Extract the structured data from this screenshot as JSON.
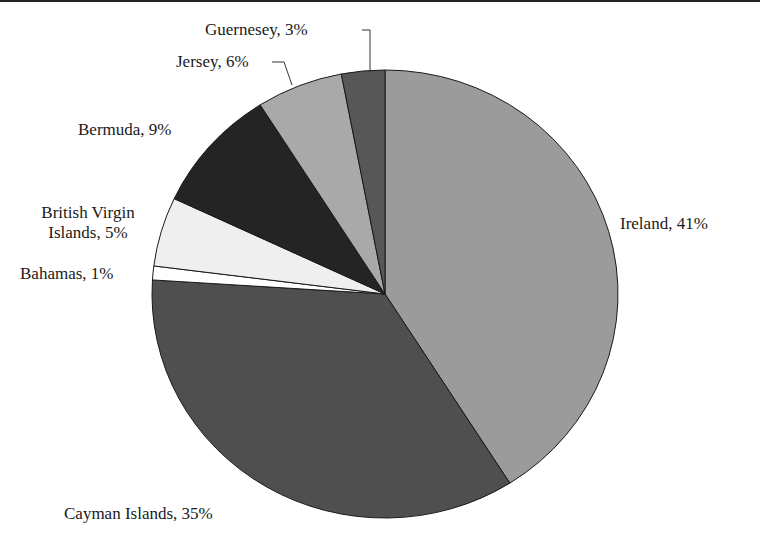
{
  "chart_data": {
    "type": "pie",
    "title": "",
    "start_angle_deg": 0,
    "direction": "clockwise",
    "slices": [
      {
        "label": "Ireland",
        "value": 41,
        "text": "Ireland, 41%",
        "color": "#9b9b9b"
      },
      {
        "label": "Cayman Islands",
        "value": 35,
        "text": "Cayman Islands, 35%",
        "color": "#4f4f4f"
      },
      {
        "label": "Bahamas",
        "value": 1,
        "text": "Bahamas, 1%",
        "color": "#ffffff"
      },
      {
        "label": "British Virgin Islands",
        "value": 5,
        "text_line1": "British Virgin",
        "text_line2": "Islands, 5%",
        "color": "#efefef"
      },
      {
        "label": "Bermuda",
        "value": 9,
        "text": "Bermuda, 9%",
        "color": "#242424"
      },
      {
        "label": "Jersey",
        "value": 6,
        "text": "Jersey, 6%",
        "color": "#a9a9a9"
      },
      {
        "label": "Guernesey",
        "value": 3,
        "text": "Guernesey, 3%",
        "color": "#575757"
      }
    ],
    "legend": "none (data labels on slices)"
  }
}
